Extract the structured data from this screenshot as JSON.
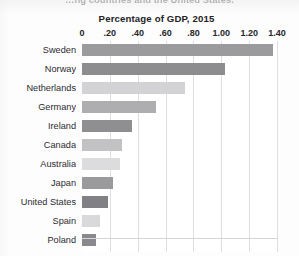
{
  "headline": {
    "text": "…ng countries and the United States.",
    "cut_off": true
  },
  "chart_title": "Percentage of GDP, 2015",
  "colors": {
    "background": "#fdfdfd",
    "plot_background": "#ffffff",
    "gridline": "#dedee0",
    "axis_text": "#26262a",
    "label_text": "#2b2b30"
  },
  "chart_data": {
    "type": "bar",
    "orientation": "horizontal",
    "title": "Percentage of GDP, 2015",
    "xlabel": "",
    "ylabel": "",
    "xlim": [
      0,
      1.4
    ],
    "grid": true,
    "legend": "none",
    "tick_labels": [
      "0",
      ".20",
      ".40",
      ".60",
      ".80",
      "1.00",
      "1.20",
      "1.40"
    ],
    "tick_values": [
      0,
      0.2,
      0.4,
      0.6,
      0.8,
      1.0,
      1.2,
      1.4
    ],
    "categories": [
      "Sweden",
      "Norway",
      "Netherlands",
      "Germany",
      "Ireland",
      "Canada",
      "Australia",
      "Japan",
      "United States",
      "Spain",
      "Poland"
    ],
    "values": [
      1.37,
      1.03,
      0.74,
      0.53,
      0.36,
      0.29,
      0.27,
      0.22,
      0.19,
      0.13,
      0.1
    ],
    "bar_colors": [
      "#9b9b9d",
      "#8d8d90",
      "#d3d3d5",
      "#aeaeb1",
      "#8f8f92",
      "#c2c2c5",
      "#dcdcde",
      "#9a9a9d",
      "#818185",
      "#d9d9db",
      "#8a8a8e"
    ]
  }
}
